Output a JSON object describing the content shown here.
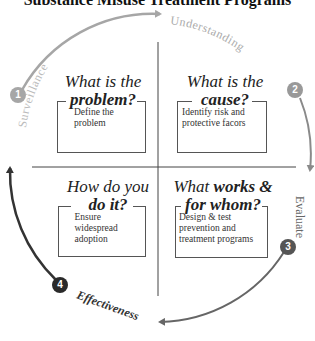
{
  "title": "Substance Misuse Treatment Programs",
  "cycle": {
    "stages": [
      {
        "number": "1",
        "label": "Surveillance",
        "color": "#a6a6a6"
      },
      {
        "number": "2",
        "label": "Understanding",
        "color": "#a6a6a6"
      },
      {
        "number": "3",
        "label": "Evaluate",
        "color": "#777777"
      },
      {
        "number": "4",
        "label": "Effectiveness",
        "color": "#3a3a3a"
      }
    ]
  },
  "quadrants": [
    {
      "head_plain": "What is the",
      "head_bold": "problem?",
      "body": "Define the problem"
    },
    {
      "head_plain": "What is the",
      "head_bold": "cause?",
      "body": "Identify risk and protective facors"
    },
    {
      "head_plain": "How do you",
      "head_bold": "do it?",
      "body": "Ensure widespread adoption"
    },
    {
      "head_plain": "What",
      "head_bold": "works &",
      "head_bold2": "for whom?",
      "body": "Design & test prevention and treatment programs"
    }
  ]
}
